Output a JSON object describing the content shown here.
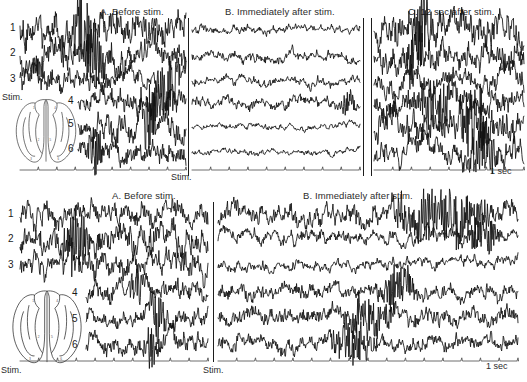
{
  "figure": {
    "width": 527,
    "height": 382,
    "background": "#ffffff",
    "trace_color": "#111111",
    "divider_color": "#1d1d1d"
  },
  "rows": [
    {
      "id": "upper-row",
      "panels": [
        {
          "id": "A",
          "label": "A. Before stim.",
          "title_x": 100,
          "title_y": 7,
          "plot_x": 20,
          "plot_w": 166
        },
        {
          "id": "B",
          "label": "B. Immediately after stim.",
          "title_x": 225,
          "title_y": 7,
          "plot_x": 192,
          "plot_w": 168
        },
        {
          "id": "C",
          "label": "C. 12 sec after stim.",
          "title_x": 408,
          "title_y": 7,
          "plot_x": 374,
          "plot_w": 150
        }
      ],
      "channels": [
        "1",
        "2",
        "3",
        "4",
        "5",
        "6"
      ],
      "stim_label": "Stim.",
      "stim_label_left": {
        "x": 2,
        "y": 92
      },
      "stim_label_bottom": {
        "x": 171,
        "y": 172
      },
      "scale_label": "1 sec",
      "scale_label_pos": {
        "x": 490,
        "y": 168
      },
      "dividers": [
        188,
        363,
        371
      ],
      "brain": {
        "x": 12,
        "y": 97,
        "w": 68,
        "h": 68
      }
    },
    {
      "id": "lower-row",
      "panels": [
        {
          "id": "A",
          "label": "A. Before stim.",
          "title_x": 112,
          "title_y": 191,
          "plot_x": 20,
          "plot_w": 188
        },
        {
          "id": "B",
          "label": "B. Immediately after stim.",
          "title_x": 303,
          "title_y": 191,
          "plot_x": 218,
          "plot_w": 300
        }
      ],
      "channels": [
        "1",
        "2",
        "3",
        "4",
        "5",
        "6"
      ],
      "stim_label": "Stim.",
      "stim_label_left": {
        "x": 1,
        "y": 366
      },
      "stim_label_bottom": {
        "x": 203,
        "y": 366
      },
      "scale_label": "1 sec",
      "scale_label_pos": {
        "x": 486,
        "y": 363
      },
      "dividers": [
        213
      ],
      "brain": {
        "x": 8,
        "y": 288,
        "w": 78,
        "h": 78
      }
    }
  ],
  "brain_diagram": {
    "name": "dorsal-brain-electrode-map",
    "electrode_numbers": [
      "1",
      "4",
      "2",
      "5",
      "3",
      "6"
    ],
    "electrodes": [
      {
        "n": "1",
        "cx": 0.34,
        "cy": 0.16
      },
      {
        "n": "4",
        "cx": 0.64,
        "cy": 0.16
      },
      {
        "n": "2",
        "cx": 0.4,
        "cy": 0.62
      },
      {
        "n": "5",
        "cx": 0.58,
        "cy": 0.62
      },
      {
        "n": "3",
        "cx": 0.3,
        "cy": 0.9
      },
      {
        "n": "6",
        "cx": 0.69,
        "cy": 0.9
      }
    ]
  },
  "chart_data": {
    "type": "line",
    "xlabel": "time",
    "ylabel": "EEG amplitude",
    "grid": false,
    "legend": "none",
    "scale_bar": "1 sec",
    "channels": [
      "1",
      "2",
      "3",
      "4",
      "5",
      "6"
    ],
    "conditions": [
      "A. Before stim.",
      "B. Immediately after stim.",
      "C. 12 sec after stim."
    ],
    "series": [
      {
        "name": "row1-A-ch1",
        "amplitude": 0.95,
        "roughness": 0.85,
        "burst": [
          0.3,
          0.45
        ]
      },
      {
        "name": "row1-A-ch2",
        "amplitude": 0.9,
        "roughness": 0.8,
        "burst": [
          0.38,
          0.52
        ]
      },
      {
        "name": "row1-A-ch3",
        "amplitude": 0.72,
        "roughness": 0.7,
        "burst": [
          0.8,
          0.98
        ]
      },
      {
        "name": "row1-A-ch4",
        "amplitude": 0.6,
        "roughness": 0.75,
        "burst": [
          0.62,
          0.8
        ]
      },
      {
        "name": "row1-A-ch5",
        "amplitude": 0.78,
        "roughness": 0.78,
        "burst": [
          0.55,
          0.75
        ]
      },
      {
        "name": "row1-A-ch6",
        "amplitude": 0.58,
        "roughness": 0.82,
        "burst": [
          0.05,
          0.25
        ]
      },
      {
        "name": "row1-B-ch1",
        "amplitude": 0.28,
        "roughness": 0.45,
        "burst": null
      },
      {
        "name": "row1-B-ch2",
        "amplitude": 0.32,
        "roughness": 0.6,
        "burst": null
      },
      {
        "name": "row1-B-ch3",
        "amplitude": 0.3,
        "roughness": 0.55,
        "burst": null
      },
      {
        "name": "row1-B-ch4",
        "amplitude": 0.34,
        "roughness": 0.62,
        "burst": [
          0.88,
          0.99
        ]
      },
      {
        "name": "row1-B-ch5",
        "amplitude": 0.22,
        "roughness": 0.4,
        "burst": null
      },
      {
        "name": "row1-B-ch6",
        "amplitude": 0.2,
        "roughness": 0.42,
        "burst": null
      },
      {
        "name": "row1-C-ch1",
        "amplitude": 0.92,
        "roughness": 0.8,
        "burst": [
          0.25,
          0.4
        ]
      },
      {
        "name": "row1-C-ch2",
        "amplitude": 0.8,
        "roughness": 0.85,
        "burst": [
          0.2,
          0.35
        ]
      },
      {
        "name": "row1-C-ch3",
        "amplitude": 0.7,
        "roughness": 0.6,
        "burst": null
      },
      {
        "name": "row1-C-ch4",
        "amplitude": 0.72,
        "roughness": 0.88,
        "burst": [
          0.3,
          0.55
        ]
      },
      {
        "name": "row1-C-ch5",
        "amplitude": 0.88,
        "roughness": 0.85,
        "burst": [
          0.55,
          0.8
        ]
      },
      {
        "name": "row1-C-ch6",
        "amplitude": 0.7,
        "roughness": 0.75,
        "burst": [
          0.62,
          0.85
        ]
      },
      {
        "name": "row2-A-ch1",
        "amplitude": 0.72,
        "roughness": 0.65,
        "burst": null
      },
      {
        "name": "row2-A-ch2",
        "amplitude": 0.78,
        "roughness": 0.85,
        "burst": [
          0.22,
          0.38
        ]
      },
      {
        "name": "row2-A-ch3",
        "amplitude": 0.85,
        "roughness": 0.6,
        "burst": null
      },
      {
        "name": "row2-A-ch4",
        "amplitude": 0.55,
        "roughness": 0.8,
        "burst": [
          0.35,
          0.48
        ]
      },
      {
        "name": "row2-A-ch5",
        "amplitude": 0.52,
        "roughness": 0.78,
        "burst": [
          0.5,
          0.68
        ]
      },
      {
        "name": "row2-A-ch6",
        "amplitude": 0.58,
        "roughness": 0.85,
        "burst": [
          0.45,
          0.62
        ]
      },
      {
        "name": "row2-B-ch1",
        "amplitude": 0.7,
        "roughness": 0.55,
        "burst": [
          0.55,
          0.95
        ]
      },
      {
        "name": "row2-B-ch2",
        "amplitude": 0.45,
        "roughness": 0.5,
        "burst": [
          0.82,
          0.95
        ]
      },
      {
        "name": "row2-B-ch3",
        "amplitude": 0.38,
        "roughness": 0.45,
        "burst": null
      },
      {
        "name": "row2-B-ch4",
        "amplitude": 0.46,
        "roughness": 0.72,
        "burst": [
          0.52,
          0.68
        ]
      },
      {
        "name": "row2-B-ch5",
        "amplitude": 0.5,
        "roughness": 0.8,
        "burst": [
          0.4,
          0.6
        ]
      },
      {
        "name": "row2-B-ch6",
        "amplitude": 0.42,
        "roughness": 0.82,
        "burst": [
          0.35,
          0.55
        ]
      }
    ]
  }
}
